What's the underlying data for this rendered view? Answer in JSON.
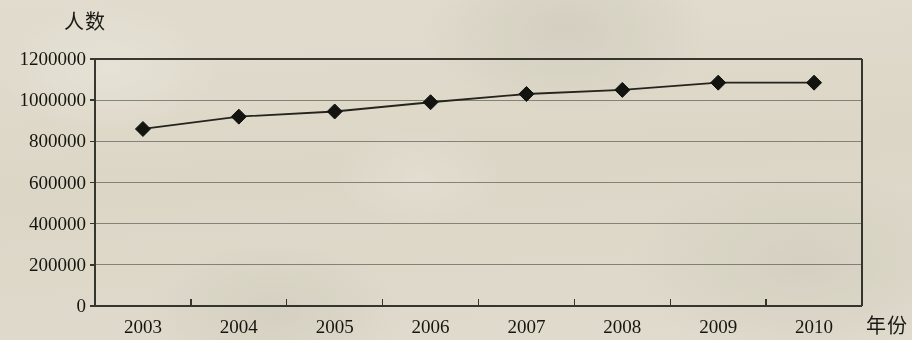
{
  "chart_data": {
    "type": "line",
    "title": "",
    "xlabel": "年份",
    "ylabel": "人数",
    "categories": [
      "2003",
      "2004",
      "2005",
      "2006",
      "2007",
      "2008",
      "2009",
      "2010"
    ],
    "values": [
      860000,
      920000,
      945000,
      990000,
      1030000,
      1050000,
      1085000,
      1085000
    ],
    "series": [
      {
        "name": "人数",
        "values": [
          860000,
          920000,
          945000,
          990000,
          1030000,
          1050000,
          1085000,
          1085000
        ]
      }
    ],
    "ylim": [
      0,
      1200000
    ],
    "ytick_values": [
      1200000,
      1000000,
      800000,
      600000,
      400000,
      200000,
      0
    ],
    "ytick_labels": [
      "1200000",
      "1000000",
      "800000",
      "600000",
      "400000",
      "200000",
      "0"
    ],
    "xtick_labels": [
      "2003",
      "2004",
      "2005",
      "2006",
      "2007",
      "2008",
      "2009",
      "2010"
    ],
    "grid": true,
    "grid_axis": "y",
    "legend": "none",
    "marker": "diamond",
    "marker_color": "#141410",
    "line_color": "#262620",
    "grid_color": "#8d8c84",
    "axis_color": "#3a3a32",
    "background_color": "#edeae1"
  }
}
